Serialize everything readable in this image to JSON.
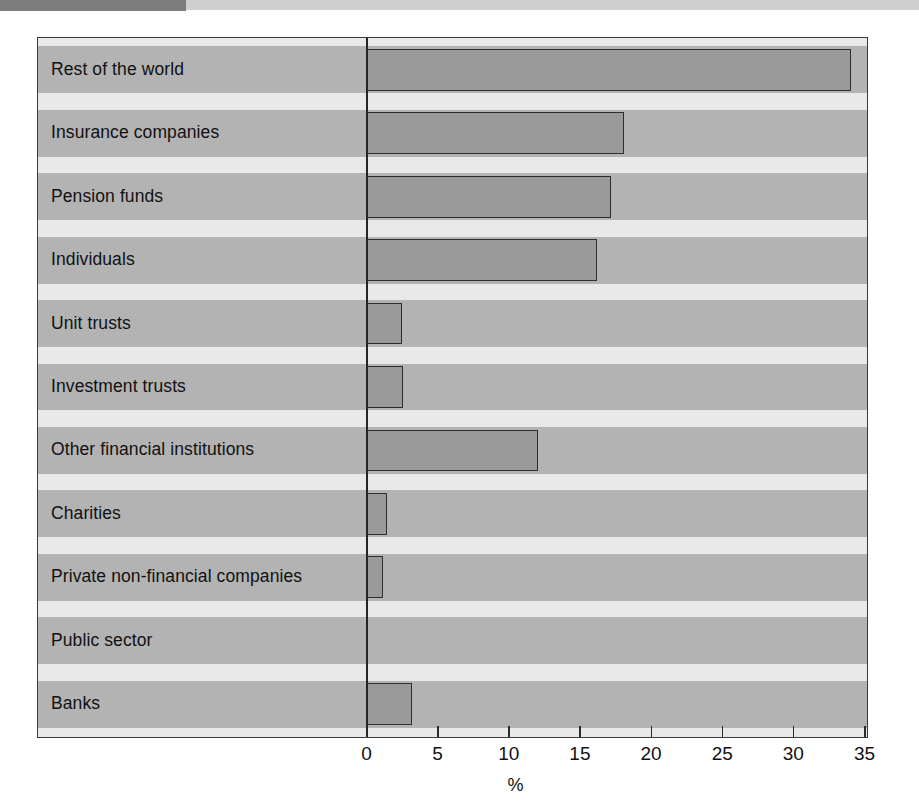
{
  "header": {
    "band_dark_color": "#7c7c7c",
    "band_light_color": "#cfcfcf"
  },
  "figure": {
    "background_color": "#ffffff",
    "plot_background_color": "#e4e4e4",
    "band_shaded_color": "#b3b3b3",
    "bar_fill_color": "#9a9a9a",
    "bar_edge_color": "#2e2e2e",
    "frame_color": "#3a3a3a"
  },
  "chart_data": {
    "type": "bar",
    "orientation": "horizontal",
    "title": "",
    "subtitle": "",
    "xlabel": "%",
    "ylabel": "",
    "xlim": [
      0,
      35
    ],
    "xticks": [
      0,
      5,
      10,
      15,
      20,
      25,
      30,
      35
    ],
    "xtick_labels": [
      "0",
      "5",
      "10",
      "15",
      "20",
      "25",
      "30",
      "35"
    ],
    "grid": false,
    "legend": null,
    "legend_position": "none",
    "categories": [
      "Rest of the world",
      "Insurance companies",
      "Pension funds",
      "Individuals",
      "Unit trusts",
      "Investment trusts",
      "Other financial institutions",
      "Charities",
      "Private non-financial companies",
      "Public sector",
      "Banks"
    ],
    "values": [
      34.1,
      18.1,
      17.2,
      16.2,
      2.5,
      2.6,
      12.1,
      1.5,
      1.2,
      0.0,
      3.2
    ],
    "annotations": []
  }
}
